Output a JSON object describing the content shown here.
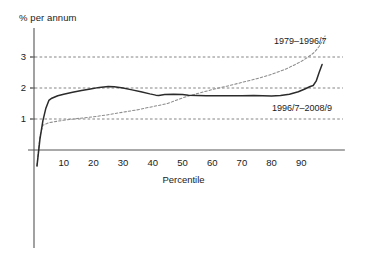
{
  "chart_data": {
    "type": "line",
    "title": "",
    "subtitle": "",
    "xlabel": "Percentile",
    "ylabel": "% per annum",
    "xlim": [
      0,
      100
    ],
    "ylim": [
      -0.55,
      3.75
    ],
    "xticks": [
      10,
      20,
      30,
      40,
      50,
      60,
      70,
      80,
      90
    ],
    "xtick_labels": [
      "10",
      "20",
      "30",
      "40",
      "50",
      "60",
      "70",
      "80",
      "90"
    ],
    "yticks": [
      1,
      2,
      3
    ],
    "ytick_labels": [
      "1",
      "2",
      "3"
    ],
    "grid": "horizontal-dashed",
    "legend_position": "inline-annotation",
    "series": [
      {
        "name": "1979–1996/7",
        "style": "dashed",
        "color": "#8c8c8c",
        "label_text": "1979–1996/7",
        "x": [
          1,
          2,
          3,
          5,
          8,
          10,
          15,
          20,
          25,
          30,
          35,
          40,
          45,
          50,
          52,
          55,
          60,
          65,
          70,
          75,
          80,
          85,
          88,
          90,
          92,
          94,
          95,
          96,
          97,
          98
        ],
        "y": [
          -0.5,
          0.45,
          0.8,
          0.88,
          0.93,
          0.96,
          1.02,
          1.07,
          1.14,
          1.22,
          1.3,
          1.4,
          1.5,
          1.68,
          1.74,
          1.82,
          1.95,
          2.06,
          2.18,
          2.3,
          2.44,
          2.62,
          2.76,
          2.86,
          2.98,
          3.12,
          3.22,
          3.34,
          3.5,
          3.68
        ]
      },
      {
        "name": "1996/7–2008/9",
        "style": "solid",
        "color": "#2b2b2b",
        "label_text": "1996/7–2008/9",
        "x": [
          1,
          2,
          3,
          4,
          5,
          6,
          8,
          10,
          13,
          16,
          19,
          22,
          25,
          27,
          30,
          33,
          36,
          39,
          41,
          42,
          44,
          47,
          50,
          52,
          55,
          58,
          62,
          66,
          70,
          74,
          77,
          80,
          83,
          86,
          89,
          91,
          93,
          94,
          95,
          96,
          97
        ],
        "y": [
          -0.52,
          0.35,
          0.95,
          1.35,
          1.6,
          1.67,
          1.75,
          1.8,
          1.86,
          1.92,
          1.97,
          2.02,
          2.05,
          2.04,
          2.0,
          1.94,
          1.88,
          1.81,
          1.77,
          1.76,
          1.79,
          1.8,
          1.79,
          1.77,
          1.76,
          1.75,
          1.75,
          1.75,
          1.75,
          1.76,
          1.75,
          1.74,
          1.76,
          1.8,
          1.88,
          1.96,
          2.05,
          2.08,
          2.22,
          2.5,
          2.76
        ]
      }
    ],
    "annotations": [
      {
        "text": "1979–1996/7",
        "x": 82,
        "y": 3.28
      },
      {
        "text": "1996/7–2008/9",
        "x": 81,
        "y": 1.12
      }
    ]
  },
  "axes": {
    "y_axis_title": "% per annum",
    "x_axis_title": "Percentile"
  },
  "colors": {
    "background": "#ffffff",
    "axis": "#555555",
    "gridline": "#777777",
    "series_dashed": "#8c8c8c",
    "series_solid": "#2b2b2b",
    "text": "#1a1a1a"
  }
}
